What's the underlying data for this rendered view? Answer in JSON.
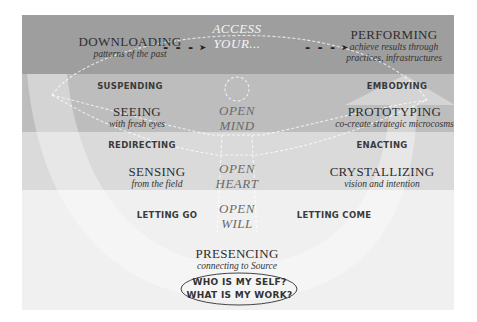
{
  "diagram": {
    "colors": {
      "band_1": "#9e9e9e",
      "band_2": "#bdbdbd",
      "band_3": "#dadada",
      "band_4": "#f0f0f0",
      "u_curve": "#ffffff",
      "text": "#2e2e2e",
      "center_text": "#6a6a6a"
    },
    "top": {
      "left": {
        "title": "DOWNLOADING",
        "subtitle": "patterns of the past"
      },
      "center": {
        "line1": "ACCESS",
        "line2": "YOUR..."
      },
      "right": {
        "title": "PERFORMING",
        "subtitle_line1": "achieve results through",
        "subtitle_line2": "practices, infrastructures"
      },
      "arrow_glyph": "- - - ➤"
    },
    "level_mind": {
      "left_transition": "SUSPENDING",
      "left": {
        "title": "SEEING",
        "subtitle": "with fresh eyes"
      },
      "center": {
        "line1": "OPEN",
        "line2": "MIND"
      },
      "right_transition": "EMBODYING",
      "right": {
        "title": "PROTOTYPING",
        "subtitle": "co-create strategic microcosms"
      }
    },
    "level_heart": {
      "left_transition": "REDIRECTING",
      "left": {
        "title": "SENSING",
        "subtitle": "from the field"
      },
      "center": {
        "line1": "OPEN",
        "line2": "HEART"
      },
      "right_transition": "ENACTING",
      "right": {
        "title": "CRYSTALLIZING",
        "subtitle": "vision and intention"
      }
    },
    "level_will": {
      "left_transition": "LETTING GO",
      "center": {
        "line1": "OPEN",
        "line2": "WILL"
      },
      "right_transition": "LETTING COME"
    },
    "bottom": {
      "title": "PRESENCING",
      "subtitle": "connecting to Source",
      "question_1": "WHO IS MY SELF?",
      "question_2": "WHAT IS MY WORK?"
    }
  }
}
